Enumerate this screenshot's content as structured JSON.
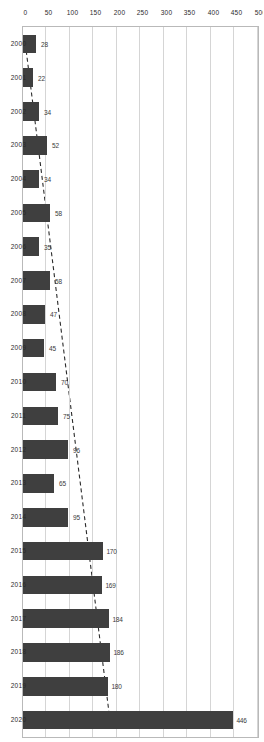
{
  "chart_data": {
    "type": "bar",
    "orientation": "horizontal",
    "title": "",
    "xlabel": "",
    "ylabel": "",
    "grid": true,
    "legend": false,
    "value_axis_range": [
      0,
      500
    ],
    "value_axis_ticks": [
      "0",
      "50",
      "100",
      "150",
      "200",
      "250",
      "300",
      "350",
      "400",
      "450",
      "500"
    ],
    "categories": [
      "2000",
      "2001",
      "2002",
      "2003",
      "2004",
      "2005",
      "2006",
      "2007",
      "2008",
      "2009",
      "2010",
      "2011",
      "2012",
      "2013",
      "2014",
      "2015",
      "2016",
      "2017",
      "2018",
      "2019",
      "2020"
    ],
    "values": [
      28,
      22,
      34,
      52,
      34,
      58,
      35,
      58,
      47,
      45,
      70,
      75,
      96,
      65,
      95,
      170,
      169,
      184,
      186,
      180,
      446
    ],
    "data_labels": [
      "28",
      "22",
      "34",
      "52",
      "34",
      "58",
      "35",
      "58",
      "47",
      "45",
      "70",
      "75",
      "96",
      "65",
      "95",
      "170",
      "169",
      "184",
      "186",
      "180",
      "446"
    ],
    "series": [
      {
        "name": "values",
        "type": "bar",
        "color": "#3f3f3f",
        "values": [
          28,
          22,
          34,
          52,
          34,
          58,
          35,
          58,
          47,
          45,
          70,
          75,
          96,
          65,
          95,
          170,
          169,
          184,
          186,
          180,
          446
        ]
      },
      {
        "name": "trendline",
        "type": "line",
        "style": "dashed",
        "color": "#2b2b2b",
        "values": [
          5,
          14,
          23,
          32,
          41,
          50,
          59,
          68,
          77,
          86,
          95,
          104,
          113,
          122,
          131,
          140,
          149,
          158,
          167,
          176,
          185
        ]
      }
    ],
    "colors": {
      "bar": "#3f3f3f",
      "grid": "#d5d5d5",
      "axis": "#b9b9b9",
      "text": "#2b2b2b",
      "background": "#ffffff"
    }
  }
}
